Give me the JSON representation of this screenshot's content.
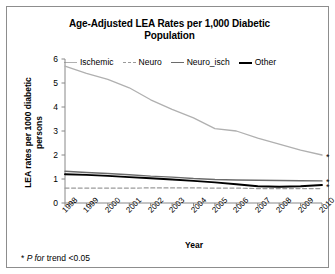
{
  "figure": {
    "title": "Age-Adjusted LEA Rates per 1,000 Diabetic Population",
    "title_line1": "Age-Adjusted LEA Rates per 1,000 Diabetic",
    "title_line2": "Population",
    "footnote_marker": "*",
    "footnote_italic": "P for",
    "footnote_rest": "trend <0.05",
    "border_color": "#8d8d8d",
    "background": "#ffffff"
  },
  "chart_data": {
    "type": "line",
    "title": "Age-Adjusted LEA Rates per 1,000 Diabetic Population",
    "xlabel": "Year",
    "ylabel": "LEA rates per 1000 diabetic persons",
    "ylabel_line1": "LEA rates per 1000 diabetic",
    "ylabel_line2": "persons",
    "categories": [
      "1998",
      "1999",
      "2000",
      "2001",
      "2002",
      "2003",
      "2004",
      "2005",
      "2006",
      "2007",
      "2008",
      "2009",
      "2010"
    ],
    "x": [
      1998,
      1999,
      2000,
      2001,
      2002,
      2003,
      2004,
      2005,
      2006,
      2007,
      2008,
      2009,
      2010
    ],
    "ylim": [
      0,
      6
    ],
    "yticks": [
      0,
      1,
      2,
      3,
      4,
      5,
      6
    ],
    "ytick_labels": [
      "0",
      "1",
      "2",
      "3",
      "4",
      "5",
      "6"
    ],
    "xlim": [
      1998,
      2010
    ],
    "grid": false,
    "legend_position": "top",
    "series": [
      {
        "name": "Ischemic",
        "color": "#b0b0b0",
        "style": "solid",
        "width": 1.3,
        "significant": true,
        "values": [
          5.7,
          5.4,
          5.15,
          4.8,
          4.3,
          3.9,
          3.55,
          3.1,
          3.0,
          2.7,
          2.45,
          2.2,
          2.0
        ]
      },
      {
        "name": "Neuro",
        "color": "#9a9a9a",
        "style": "dashed",
        "width": 1.2,
        "significant": false,
        "values": [
          0.62,
          0.62,
          0.62,
          0.62,
          0.63,
          0.63,
          0.63,
          0.62,
          0.62,
          0.6,
          0.6,
          0.6,
          0.6
        ]
      },
      {
        "name": "Neuro_isch",
        "color": "#6b6b6b",
        "style": "solid",
        "width": 1.4,
        "significant": true,
        "values": [
          1.32,
          1.27,
          1.23,
          1.18,
          1.12,
          1.08,
          1.02,
          0.98,
          0.96,
          0.95,
          0.94,
          0.93,
          0.92
        ]
      },
      {
        "name": "Other",
        "color": "#000000",
        "style": "solid",
        "width": 1.9,
        "significant": true,
        "values": [
          1.2,
          1.17,
          1.13,
          1.08,
          1.03,
          0.98,
          0.92,
          0.86,
          0.78,
          0.7,
          0.68,
          0.7,
          0.75
        ]
      }
    ],
    "annotations": [
      {
        "text": "*",
        "series": "Ischemic",
        "at": "line-end"
      },
      {
        "text": "*",
        "series": "Neuro_isch",
        "at": "line-end"
      },
      {
        "text": "*",
        "series": "Other",
        "at": "line-end"
      }
    ]
  }
}
